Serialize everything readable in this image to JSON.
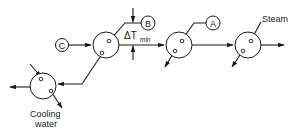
{
  "diagram": {
    "labels": {
      "a": "A",
      "b": "B",
      "c": "C",
      "delta_t": "ΔT",
      "delta_t_sub": "min",
      "steam": "Steam",
      "cooling_line1": "Cooling",
      "cooling_line2": "water"
    },
    "colors": {
      "stroke": "#1a1a1a",
      "background": "#ffffff"
    }
  }
}
